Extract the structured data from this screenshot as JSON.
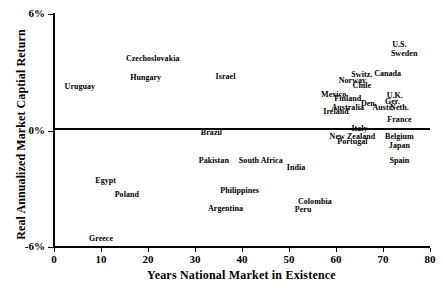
{
  "chart_data": {
    "type": "scatter",
    "title": "",
    "xlabel": "Years National Market in Existence",
    "ylabel": "Real Annualized Market Captial Return",
    "xlim": [
      0,
      80
    ],
    "ylim": [
      -6,
      6
    ],
    "xticks": [
      "0",
      "10",
      "20",
      "30",
      "40",
      "50",
      "60",
      "70",
      "80"
    ],
    "yticks": [
      "6%",
      "0%",
      "-6%"
    ],
    "grid": false,
    "legend": "none",
    "zero_reference_line": 0,
    "point_label_mode": "text-only",
    "points": [
      {
        "label": "Uruguay",
        "x": 5.5,
        "y": 2.25
      },
      {
        "label": "Czechoslovakia",
        "x": 21.0,
        "y": 3.7
      },
      {
        "label": "Hungary",
        "x": 19.5,
        "y": 2.7
      },
      {
        "label": "Israel",
        "x": 36.5,
        "y": 2.75
      },
      {
        "label": "U.S.",
        "x": 73.5,
        "y": 4.4
      },
      {
        "label": "Sweden",
        "x": 74.5,
        "y": 3.95
      },
      {
        "label": "Switz.",
        "x": 65.5,
        "y": 2.85
      },
      {
        "label": "Canada",
        "x": 71.0,
        "y": 2.9
      },
      {
        "label": "Norway",
        "x": 63.5,
        "y": 2.55
      },
      {
        "label": "Chile",
        "x": 65.5,
        "y": 2.3
      },
      {
        "label": "Mexico",
        "x": 59.5,
        "y": 1.85
      },
      {
        "label": "Finland",
        "x": 62.5,
        "y": 1.6
      },
      {
        "label": "U.K.",
        "x": 72.5,
        "y": 1.8
      },
      {
        "label": "Ger.",
        "x": 72.0,
        "y": 1.45
      },
      {
        "label": "Den.",
        "x": 67.0,
        "y": 1.35
      },
      {
        "label": "Austr.",
        "x": 70.0,
        "y": 1.15
      },
      {
        "label": "Australia",
        "x": 62.5,
        "y": 1.15
      },
      {
        "label": "Neth.",
        "x": 73.5,
        "y": 1.15
      },
      {
        "label": "Ireland",
        "x": 60.0,
        "y": 0.95
      },
      {
        "label": "France",
        "x": 73.5,
        "y": 0.55
      },
      {
        "label": "Italy",
        "x": 65.0,
        "y": 0.1
      },
      {
        "label": "Brazil",
        "x": 33.5,
        "y": -0.15
      },
      {
        "label": "New Zealand",
        "x": 63.5,
        "y": -0.35
      },
      {
        "label": "Belgium",
        "x": 73.5,
        "y": -0.35
      },
      {
        "label": "Portugal",
        "x": 63.5,
        "y": -0.6
      },
      {
        "label": "Japan",
        "x": 73.5,
        "y": -0.8
      },
      {
        "label": "Pakistan",
        "x": 34.0,
        "y": -1.55
      },
      {
        "label": "South Africa",
        "x": 44.0,
        "y": -1.55
      },
      {
        "label": "Spain",
        "x": 73.5,
        "y": -1.55
      },
      {
        "label": "India",
        "x": 51.5,
        "y": -1.95
      },
      {
        "label": "Egypt",
        "x": 11.0,
        "y": -2.6
      },
      {
        "label": "Philippines",
        "x": 39.5,
        "y": -3.1
      },
      {
        "label": "Poland",
        "x": 15.5,
        "y": -3.3
      },
      {
        "label": "Colombia",
        "x": 55.5,
        "y": -3.7
      },
      {
        "label": "Argentina",
        "x": 36.5,
        "y": -4.05
      },
      {
        "label": "Peru",
        "x": 53.0,
        "y": -4.1
      },
      {
        "label": "Greece",
        "x": 10.0,
        "y": -5.6
      }
    ]
  },
  "colors": {
    "axis": "#000000",
    "text": "#000000",
    "background": "#ffffff"
  }
}
